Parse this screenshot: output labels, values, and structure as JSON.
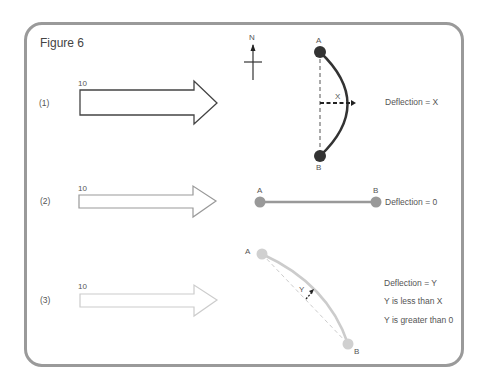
{
  "figure": {
    "title": "Figure 6",
    "compass_label": "N"
  },
  "rows": [
    {
      "index_label": "(1)",
      "force_label": "10",
      "arrow_color": "#444444",
      "point_a": "A",
      "point_b": "B",
      "deflection_var": "X",
      "notes": [
        "Deflection = X"
      ]
    },
    {
      "index_label": "(2)",
      "force_label": "10",
      "arrow_color": "#999999",
      "point_a": "A",
      "point_b": "B",
      "notes": [
        "Deflection = 0"
      ]
    },
    {
      "index_label": "(3)",
      "force_label": "10",
      "arrow_color": "#cccccc",
      "point_a": "A",
      "point_b": "B",
      "deflection_var": "Y",
      "notes": [
        "Deflection = Y",
        "Y is less than X",
        "Y is greater than 0"
      ]
    }
  ]
}
